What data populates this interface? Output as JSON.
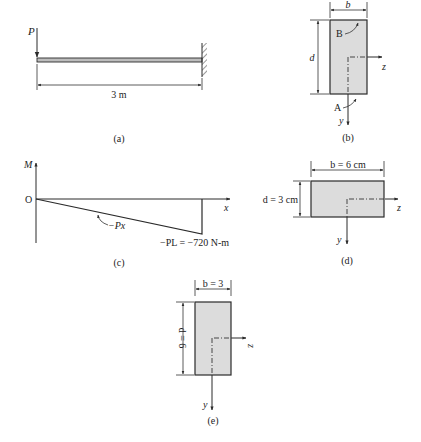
{
  "figure": {
    "panels": {
      "a": {
        "caption": "(a)",
        "load_label": "P",
        "span_label": "3 m"
      },
      "b": {
        "caption": "(b)",
        "width_label": "b",
        "depth_label": "d",
        "point_top": "B",
        "point_bottom": "A",
        "axis_z": "z",
        "axis_y": "y"
      },
      "c": {
        "caption": "(c)",
        "y_axis_label": "M",
        "origin_label": "O",
        "x_axis_label": "x",
        "curve_label": "−Px",
        "end_value_label": "−PL = −720 N-m"
      },
      "d": {
        "caption": "(d)",
        "width_label": "b = 6 cm",
        "depth_label": "d = 3 cm",
        "axis_z": "z",
        "axis_y": "y"
      },
      "e": {
        "caption": "(e)",
        "width_label": "b = 3",
        "depth_label": "d = 6",
        "axis_z": "z",
        "axis_y": "y"
      }
    }
  },
  "colors": {
    "section_fill": "#dcdcdc",
    "line": "#2a2a2a"
  }
}
